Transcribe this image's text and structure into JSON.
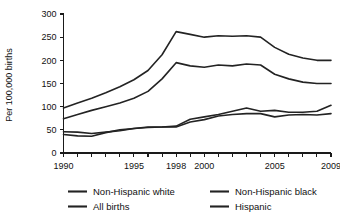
{
  "chart_data": {
    "type": "line",
    "title": "",
    "xlabel": "",
    "ylabel": "Per 100,000 births",
    "xlim": [
      1990,
      2009
    ],
    "ylim": [
      0,
      300
    ],
    "yticks": [
      0,
      50,
      100,
      150,
      200,
      250,
      300
    ],
    "ytick_labels": [
      "0",
      "50",
      "100",
      "150",
      "200",
      "250",
      "300"
    ],
    "x": [
      1990,
      1991,
      1992,
      1993,
      1994,
      1995,
      1996,
      1997,
      1998,
      1999,
      2000,
      2001,
      2002,
      2003,
      2004,
      2005,
      2006,
      2007,
      2008,
      2009
    ],
    "xticks": [
      1990,
      1991,
      1992,
      1993,
      1994,
      1995,
      1996,
      1997,
      1998,
      1999,
      2000,
      2001,
      2002,
      2003,
      2004,
      2005,
      2006,
      2007,
      2008,
      2009
    ],
    "xtick_labels_shown": [
      {
        "year": 1990,
        "label": "1990"
      },
      {
        "year": 1995,
        "label": "1995"
      },
      {
        "year": 1998,
        "label": "1998"
      },
      {
        "year": 2000,
        "label": "2000"
      },
      {
        "year": 2005,
        "label": "2005"
      },
      {
        "year": 2009,
        "label": "2009"
      }
    ],
    "grid": false,
    "legend_position": "bottom",
    "series": [
      {
        "name": "Non-Hispanic black",
        "values": [
          97,
          108,
          118,
          130,
          143,
          158,
          178,
          212,
          262,
          256,
          250,
          253,
          252,
          253,
          250,
          228,
          213,
          205,
          200,
          200
        ]
      },
      {
        "name": "All births",
        "values": [
          74,
          83,
          92,
          100,
          108,
          118,
          133,
          160,
          195,
          188,
          185,
          190,
          188,
          192,
          190,
          170,
          160,
          153,
          150,
          150
        ]
      },
      {
        "name": "Non-Hispanic white",
        "values": [
          46,
          45,
          42,
          45,
          48,
          53,
          55,
          56,
          58,
          73,
          78,
          83,
          90,
          97,
          90,
          92,
          88,
          88,
          90,
          103
        ]
      },
      {
        "name": "Hispanic",
        "values": [
          40,
          37,
          36,
          44,
          50,
          53,
          56,
          56,
          56,
          67,
          72,
          80,
          83,
          85,
          85,
          78,
          82,
          83,
          82,
          85
        ]
      }
    ],
    "legend_entries": [
      {
        "label": "Non-Hispanic white",
        "row": 0,
        "col": 0
      },
      {
        "label": "Non-Hispanic black",
        "row": 0,
        "col": 1
      },
      {
        "label": "All births",
        "row": 1,
        "col": 0
      },
      {
        "label": "Hispanic",
        "row": 1,
        "col": 1
      }
    ],
    "line_color": "#232323"
  }
}
